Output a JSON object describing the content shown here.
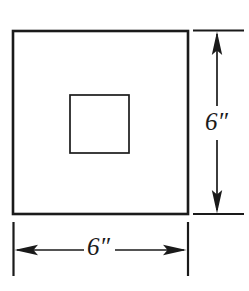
{
  "figure": {
    "kind": "geometry-diagram",
    "background_color": "#ffffff",
    "ink_color": "#1a1a1a"
  },
  "shapes": {
    "outer_square": {
      "name": "outer-square",
      "x": 13,
      "y": 31,
      "width": 175,
      "height": 183,
      "stroke_width": 2.6
    },
    "inner_square": {
      "name": "inner-square",
      "x": 70,
      "y": 95,
      "width": 59,
      "height": 58,
      "stroke_width": 1.7
    }
  },
  "dimensions": {
    "width": {
      "label": "6″",
      "value": 6,
      "unit": "inch",
      "orientation": "horizontal",
      "line_y": 250,
      "from_x": 13,
      "to_x": 188,
      "extension_top": 222,
      "extension_bottom": 276
    },
    "height": {
      "label": "6″",
      "value": 6,
      "unit": "inch",
      "orientation": "vertical",
      "line_x": 217,
      "from_y": 31,
      "to_y": 214,
      "extension_left": 193,
      "extension_right": 244
    }
  }
}
